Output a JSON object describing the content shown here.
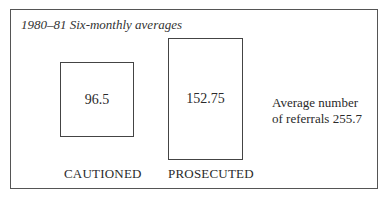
{
  "title": "1980–81 Six-monthly averages",
  "boxes": [
    {
      "label": "CAUTIONED",
      "value": "96.5"
    },
    {
      "label": "PROSECUTED",
      "value": "152.75"
    }
  ],
  "note": {
    "line1": "Average number",
    "line2": "of referrals 255.7"
  },
  "chart_data": {
    "type": "bar",
    "title": "1980–81 Six-monthly averages",
    "categories": [
      "CAUTIONED",
      "PROSECUTED"
    ],
    "values": [
      96.5,
      152.75
    ],
    "annotations": [
      "Average number of referrals 255.7"
    ]
  }
}
